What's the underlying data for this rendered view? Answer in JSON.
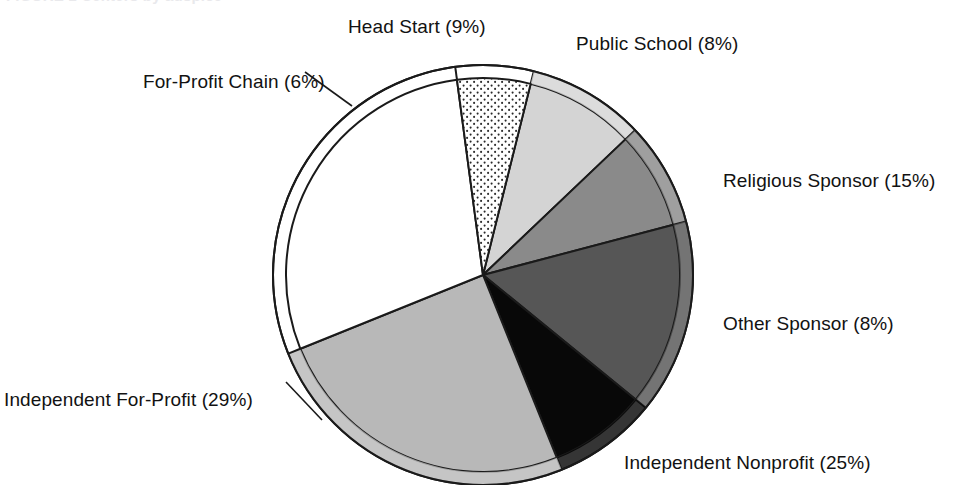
{
  "figure": {
    "caption": "FIGURE 1   Centers by auspice",
    "background_color": "#ffffff",
    "text_color": "#121212"
  },
  "chart_data": {
    "type": "pie",
    "title": "",
    "subtitle": "",
    "xlabel": "",
    "ylabel": "",
    "legend_position": "none",
    "grid": false,
    "labels_show_percent": true,
    "total_percent": 100,
    "categories": [
      "Head Start",
      "Public School",
      "Religious Sponsor",
      "Other Sponsor",
      "Independent Nonprofit",
      "Independent For-Profit",
      "For-Profit Chain"
    ],
    "values": [
      9,
      8,
      15,
      8,
      25,
      29,
      6
    ],
    "slices": [
      {
        "name": "Head Start",
        "value": 9,
        "label": "Head Start (9%)",
        "color": "#d4d4d4",
        "fill_style": "solid",
        "label_x": 348,
        "label_y": 16,
        "leader_line": false
      },
      {
        "name": "Public School",
        "value": 8,
        "label": "Public School (8%)",
        "color": "#8a8a8a",
        "fill_style": "solid",
        "label_x": 576,
        "label_y": 33,
        "leader_line": false
      },
      {
        "name": "Religious Sponsor",
        "value": 15,
        "label": "Religious Sponsor (15%)",
        "color": "#565656",
        "fill_style": "solid",
        "label_x": 723,
        "label_y": 170,
        "leader_line": false
      },
      {
        "name": "Other Sponsor",
        "value": 8,
        "label": "Other Sponsor (8%)",
        "color": "#080808",
        "fill_style": "solid",
        "label_x": 723,
        "label_y": 313,
        "leader_line": false
      },
      {
        "name": "Independent Nonprofit",
        "value": 25,
        "label": "Independent Nonprofit (25%)",
        "color": "#b8b8b8",
        "fill_style": "solid",
        "label_x": 624,
        "label_y": 452,
        "leader_line": false
      },
      {
        "name": "Independent For-Profit",
        "value": 29,
        "label": "Independent For-Profit (29%)",
        "color": "#ffffff",
        "fill_style": "solid",
        "label_x": 4,
        "label_y": 389,
        "leader_line": true
      },
      {
        "name": "For-Profit Chain",
        "value": 6,
        "label": "For-Profit Chain (6%)",
        "color": "#ffffff",
        "fill_style": "stipple",
        "label_x": 143,
        "label_y": 71,
        "leader_line": true
      }
    ],
    "geometry": {
      "center_x": 483,
      "center_y": 275,
      "radius": 210,
      "rim_radius": 197,
      "start_angle_deg": -76,
      "direction": "clockwise",
      "outline_color": "#1a1a1a",
      "outline_width": 2
    }
  }
}
